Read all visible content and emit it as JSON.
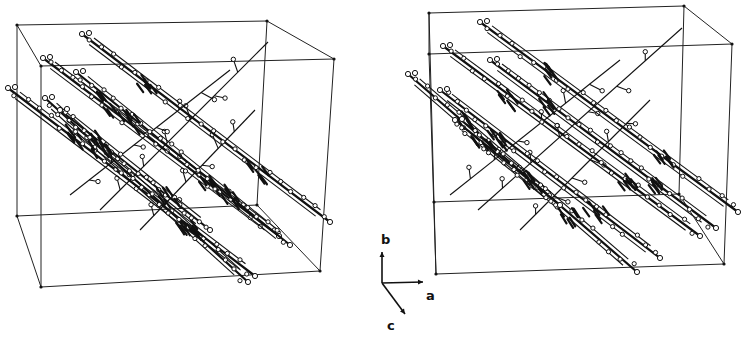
{
  "figure": {
    "background": "#ffffff",
    "ink_color": "#111111"
  },
  "axes_indicator": {
    "origin": [
      382,
      283
    ],
    "axes": [
      {
        "label": "b",
        "tip": [
          382,
          252
        ],
        "label_pos": [
          381,
          244
        ]
      },
      {
        "label": "a",
        "tip": [
          423,
          282
        ],
        "label_pos": [
          426,
          300
        ]
      },
      {
        "label": "c",
        "tip": [
          405,
          314
        ],
        "label_pos": [
          387,
          330
        ]
      }
    ]
  },
  "views": [
    {
      "name": "left-view",
      "unit_cell": {
        "back": [
          [
            17,
            25
          ],
          [
            267,
            21
          ],
          [
            257,
            205
          ],
          [
            17,
            216
          ]
        ],
        "front": [
          [
            41,
            66
          ],
          [
            334,
            59
          ],
          [
            320,
            271
          ],
          [
            41,
            287
          ]
        ]
      },
      "chains": [
        [
          [
            82,
            34
          ],
          [
            330,
            222
          ]
        ],
        [
          [
            43,
            58
          ],
          [
            279,
            236
          ]
        ],
        [
          [
            8,
            88
          ],
          [
            255,
            276
          ]
        ],
        [
          [
            45,
            98
          ],
          [
            248,
            282
          ]
        ],
        [
          [
            76,
            72
          ],
          [
            290,
            245
          ]
        ],
        [
          [
            60,
            110
          ],
          [
            210,
            230
          ]
        ]
      ],
      "cross_links": [
        [
          [
            100,
            210
          ],
          [
            268,
            42
          ]
        ],
        [
          [
            70,
            195
          ],
          [
            230,
            70
          ]
        ],
        [
          [
            140,
            230
          ],
          [
            255,
            110
          ]
        ]
      ]
    },
    {
      "name": "right-view",
      "unit_cell": {
        "back": [
          [
            429,
            13
          ],
          [
            684,
            6
          ],
          [
            679,
            194
          ],
          [
            434,
            202
          ]
        ],
        "front": [
          [
            429,
            54
          ],
          [
            732,
            44
          ],
          [
            724,
            264
          ],
          [
            436,
            274
          ]
        ]
      },
      "chains": [
        [
          [
            480,
            22
          ],
          [
            738,
            212
          ]
        ],
        [
          [
            443,
            46
          ],
          [
            700,
            236
          ]
        ],
        [
          [
            408,
            74
          ],
          [
            637,
            272
          ]
        ],
        [
          [
            440,
            90
          ],
          [
            660,
            258
          ]
        ],
        [
          [
            490,
            60
          ],
          [
            716,
            228
          ]
        ],
        [
          [
            455,
            120
          ],
          [
            560,
            205
          ]
        ]
      ],
      "cross_links": [
        [
          [
            478,
            210
          ],
          [
            682,
            28
          ]
        ],
        [
          [
            450,
            195
          ],
          [
            620,
            60
          ]
        ],
        [
          [
            520,
            230
          ],
          [
            650,
            100
          ]
        ]
      ]
    }
  ]
}
